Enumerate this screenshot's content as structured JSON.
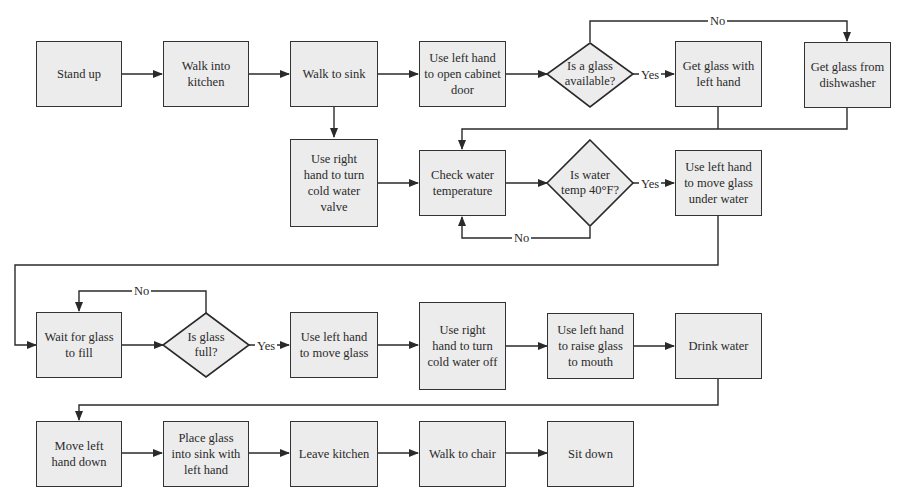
{
  "diagram": {
    "type": "flowchart",
    "nodes": {
      "stand_up": "Stand up",
      "walk_into_kitchen": "Walk into kitchen",
      "walk_to_sink": "Walk to sink",
      "open_cabinet": "Use left hand to open cabinet door",
      "glass_available": "Is a glass available?",
      "get_glass_left": "Get glass with left hand",
      "get_glass_dishwasher": "Get glass from dishwasher",
      "turn_valve": "Use right hand to turn cold water valve",
      "check_temp": "Check water temperature",
      "water_temp": "Is water temp 40°F?",
      "move_under_water": "Use left hand to move glass under water",
      "wait_fill": "Wait for glass to fill",
      "glass_full": "Is glass full?",
      "move_glass": "Use left hand to move glass",
      "turn_off": "Use right hand to turn cold water off",
      "raise_glass": "Use left hand to raise glass to mouth",
      "drink": "Drink water",
      "move_hand_down": "Move left hand down",
      "place_glass": "Place glass into sink with left hand",
      "leave_kitchen": "Leave kitchen",
      "walk_chair": "Walk to chair",
      "sit_down": "Sit down"
    },
    "edge_labels": {
      "glass_no": "No",
      "glass_yes": "Yes",
      "temp_yes": "Yes",
      "temp_no": "No",
      "full_no": "No",
      "full_yes": "Yes"
    },
    "edges": [
      [
        "stand_up",
        "walk_into_kitchen",
        ""
      ],
      [
        "walk_into_kitchen",
        "walk_to_sink",
        ""
      ],
      [
        "walk_to_sink",
        "open_cabinet",
        ""
      ],
      [
        "walk_to_sink",
        "turn_valve",
        ""
      ],
      [
        "open_cabinet",
        "glass_available",
        ""
      ],
      [
        "glass_available",
        "get_glass_left",
        "Yes"
      ],
      [
        "glass_available",
        "get_glass_dishwasher",
        "No"
      ],
      [
        "get_glass_left",
        "check_temp",
        ""
      ],
      [
        "get_glass_dishwasher",
        "check_temp",
        ""
      ],
      [
        "turn_valve",
        "check_temp",
        ""
      ],
      [
        "check_temp",
        "water_temp",
        ""
      ],
      [
        "water_temp",
        "move_under_water",
        "Yes"
      ],
      [
        "water_temp",
        "check_temp",
        "No"
      ],
      [
        "move_under_water",
        "wait_fill",
        ""
      ],
      [
        "wait_fill",
        "glass_full",
        ""
      ],
      [
        "glass_full",
        "move_glass",
        "Yes"
      ],
      [
        "glass_full",
        "wait_fill",
        "No"
      ],
      [
        "move_glass",
        "turn_off",
        ""
      ],
      [
        "turn_off",
        "raise_glass",
        ""
      ],
      [
        "raise_glass",
        "drink",
        ""
      ],
      [
        "drink",
        "move_hand_down",
        ""
      ],
      [
        "move_hand_down",
        "place_glass",
        ""
      ],
      [
        "place_glass",
        "leave_kitchen",
        ""
      ],
      [
        "leave_kitchen",
        "walk_chair",
        ""
      ],
      [
        "walk_chair",
        "sit_down",
        ""
      ]
    ]
  }
}
